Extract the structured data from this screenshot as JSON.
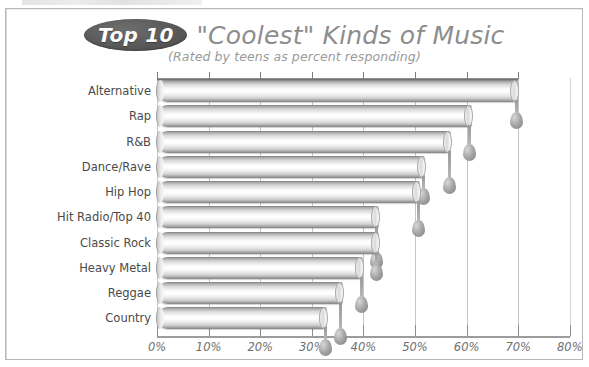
{
  "title": {
    "badge": "Top 10",
    "main": "\"Coolest\" Kinds of Music",
    "subtitle": "(Rated by teens as percent responding)"
  },
  "chart_data": {
    "type": "bar",
    "orientation": "horizontal",
    "title": "Top 10 \"Coolest\" Kinds of Music",
    "subtitle": "(Rated by teens as percent responding)",
    "xlabel": "",
    "ylabel": "",
    "xlim": [
      0,
      80
    ],
    "xtick_labels": [
      "0%",
      "10%",
      "20%",
      "30%",
      "40%",
      "50%",
      "60%",
      "70%",
      "80%"
    ],
    "xticks": [
      0,
      10,
      20,
      30,
      40,
      50,
      60,
      70,
      80
    ],
    "grid": true,
    "legend": "none",
    "categories": [
      "Alternative",
      "Rap",
      "R&B",
      "Dance/Rave",
      "Hip Hop",
      "Hit Radio/Top 40",
      "Classic Rock",
      "Heavy Metal",
      "Reggae",
      "Country"
    ],
    "values": [
      70,
      61,
      57,
      52,
      51,
      43,
      43,
      40,
      36,
      33
    ]
  },
  "colors": {
    "badge_fill": "#595959",
    "badge_text": "#fdfdfd",
    "title_text": "#8d8d8d",
    "subtitle_text": "#9a9a9a",
    "bar_light": "#ffffff",
    "bar_dark": "#7d7d7d",
    "axis": "#8e8e8e",
    "grid": "#c5c5c5",
    "label_text": "#4a4a4a",
    "frame": "#b7b7b7"
  }
}
